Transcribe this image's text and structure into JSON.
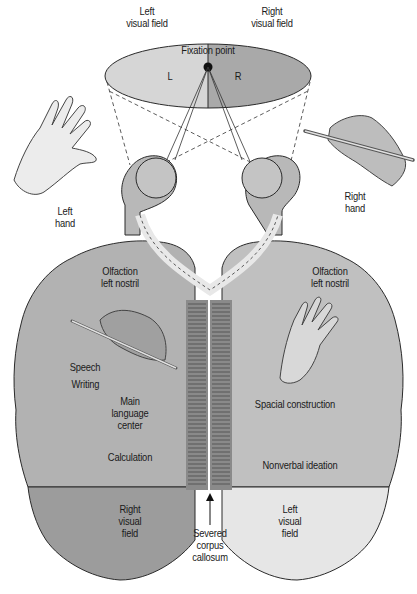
{
  "diagram": {
    "type": "split-brain anatomy illustration",
    "colors": {
      "left_field": "#d6d6d6",
      "right_field": "#a9a9a9",
      "left_hemisphere": "#b2b2b2",
      "right_hemisphere": "#c0c0c0",
      "left_occipital": "#9c9c9c",
      "right_occipital": "#e6e6e6",
      "corpus_callosum": "#8a8a8a",
      "outline": "#2a2a2a"
    },
    "visual_field": {
      "left_title": "Left\nvisual field",
      "right_title": "Right\nvisual field",
      "fixation": "Fixation point",
      "left_letter": "L",
      "right_letter": "R"
    },
    "hands": {
      "left": "Left\nhand",
      "right": "Right\nhand"
    },
    "left_hemisphere": {
      "olfaction": "Olfaction\nleft nostril",
      "speech": "Speech",
      "writing": "Writing",
      "language": "Main\nlanguage\ncenter",
      "calculation": "Calculation",
      "visual": "Right\nvisual\nfield"
    },
    "right_hemisphere": {
      "olfaction": "Olfaction\nright nostril",
      "spatial": "Spacial construction",
      "nonverbal": "Nonverbal ideation",
      "visual": "Left\nvisual\nfield"
    },
    "corpus_callosum": "Severed\ncorpus\ncallosum"
  }
}
